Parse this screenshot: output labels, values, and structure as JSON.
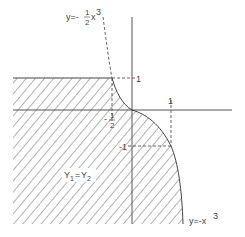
{
  "diagram": {
    "title": "",
    "labels": {
      "upper_curve": {
        "lhs": "y=-",
        "num": "1",
        "den": "2",
        "rhs": "x",
        "exp": "3"
      },
      "lower_curve": {
        "lhs": "y=-x",
        "exp": "3"
      },
      "y_tick_pos": "1",
      "x_tick_pos": "1",
      "y_tick_neg": "-1",
      "x_tick_neg_half": {
        "sign": "-",
        "num": "1",
        "den": "2"
      },
      "region": {
        "a": "Y",
        "a_sub": "1",
        "eq": "=",
        "b": "Y",
        "b_sub": "2"
      }
    },
    "curves": [
      {
        "name": "y = -1/2 x^3",
        "style": "dashed",
        "role": "upper boundary extension"
      },
      {
        "name": "y = -x^3",
        "style": "solid",
        "role": "right boundary of shaded region"
      }
    ],
    "shaded_region": "Y1 = Y2",
    "colors": {
      "line": "#444444",
      "hatch": "#666666",
      "background": "#ffffff"
    }
  }
}
